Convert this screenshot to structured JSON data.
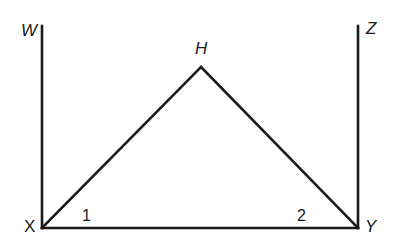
{
  "diagram": {
    "type": "geometry",
    "points": {
      "W": {
        "label": "W",
        "x": 42,
        "y": 24
      },
      "X": {
        "label": "X",
        "x": 42,
        "y": 228
      },
      "Y": {
        "label": "Y",
        "x": 358,
        "y": 228
      },
      "Z": {
        "label": "Z",
        "x": 358,
        "y": 25
      },
      "H": {
        "label": "H",
        "x": 201,
        "y": 67
      }
    },
    "segments": [
      "WX",
      "ZY",
      "XY",
      "XH",
      "HY"
    ],
    "angles": [
      {
        "label": "1",
        "vertex": "X"
      },
      {
        "label": "2",
        "vertex": "Y"
      }
    ],
    "colors": {
      "stroke": "#1a1a1a",
      "background": "#ffffff"
    }
  }
}
